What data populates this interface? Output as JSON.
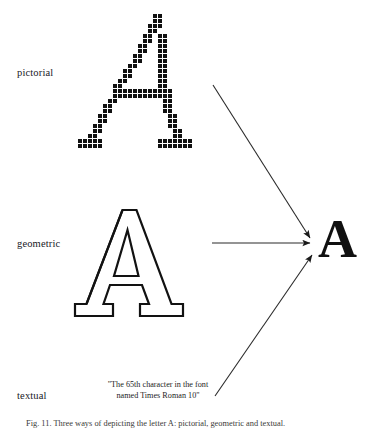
{
  "figure": {
    "caption": "Fig. 11.  Three ways of depicting the letter A: pictorial, geometric and textual.",
    "target_letter": "A",
    "rows": [
      {
        "label": "pictorial",
        "kind": "bitmap-grid"
      },
      {
        "label": "geometric",
        "kind": "outline-glyph"
      },
      {
        "label": "textual",
        "kind": "text-description"
      }
    ],
    "textual_description": {
      "line1": "\"The 65th character in the font",
      "line2": "named Times Roman 10\""
    },
    "arrows": [
      {
        "name": "arrow-pictorial-to-target",
        "from": [
          213,
          85
        ],
        "to": [
          311,
          239
        ]
      },
      {
        "name": "arrow-geometric-to-target",
        "from": [
          212,
          243
        ],
        "to": [
          311,
          243
        ]
      },
      {
        "name": "arrow-textual-to-target",
        "from": [
          215,
          396
        ],
        "to": [
          313,
          254
        ]
      }
    ],
    "colors": {
      "ink": "#111111",
      "paper": "#ffffff",
      "caption": "#3a3a38"
    },
    "pictorial_grid": {
      "cell": 5,
      "dot": 4,
      "cells": [
        [
          15,
          0
        ],
        [
          16,
          0
        ],
        [
          15,
          1
        ],
        [
          16,
          1
        ],
        [
          14,
          2
        ],
        [
          15,
          2
        ],
        [
          16,
          2
        ],
        [
          14,
          3
        ],
        [
          15,
          3
        ],
        [
          13,
          4
        ],
        [
          14,
          4
        ],
        [
          16,
          4
        ],
        [
          17,
          4
        ],
        [
          13,
          5
        ],
        [
          14,
          5
        ],
        [
          16,
          5
        ],
        [
          17,
          5
        ],
        [
          12,
          6
        ],
        [
          13,
          6
        ],
        [
          16,
          6
        ],
        [
          17,
          6
        ],
        [
          12,
          7
        ],
        [
          13,
          7
        ],
        [
          16,
          7
        ],
        [
          17,
          7
        ],
        [
          11,
          8
        ],
        [
          12,
          8
        ],
        [
          16,
          8
        ],
        [
          17,
          8
        ],
        [
          11,
          9
        ],
        [
          12,
          9
        ],
        [
          16,
          9
        ],
        [
          17,
          9
        ],
        [
          10,
          10
        ],
        [
          11,
          10
        ],
        [
          16,
          10
        ],
        [
          17,
          10
        ],
        [
          9,
          11
        ],
        [
          10,
          11
        ],
        [
          16,
          11
        ],
        [
          17,
          11
        ],
        [
          9,
          12
        ],
        [
          10,
          12
        ],
        [
          16,
          12
        ],
        [
          17,
          12
        ],
        [
          8,
          13
        ],
        [
          9,
          13
        ],
        [
          16,
          13
        ],
        [
          17,
          13
        ],
        [
          7,
          14
        ],
        [
          8,
          14
        ],
        [
          16,
          14
        ],
        [
          17,
          14
        ],
        [
          7,
          15
        ],
        [
          8,
          15
        ],
        [
          9,
          15
        ],
        [
          10,
          15
        ],
        [
          11,
          15
        ],
        [
          12,
          15
        ],
        [
          13,
          15
        ],
        [
          14,
          15
        ],
        [
          15,
          15
        ],
        [
          16,
          15
        ],
        [
          17,
          15
        ],
        [
          18,
          15
        ],
        [
          7,
          16
        ],
        [
          8,
          16
        ],
        [
          9,
          16
        ],
        [
          10,
          16
        ],
        [
          11,
          16
        ],
        [
          12,
          16
        ],
        [
          13,
          16
        ],
        [
          14,
          16
        ],
        [
          15,
          16
        ],
        [
          16,
          16
        ],
        [
          17,
          16
        ],
        [
          18,
          16
        ],
        [
          6,
          17
        ],
        [
          7,
          17
        ],
        [
          17,
          17
        ],
        [
          18,
          17
        ],
        [
          5,
          18
        ],
        [
          6,
          18
        ],
        [
          17,
          18
        ],
        [
          18,
          18
        ],
        [
          5,
          19
        ],
        [
          6,
          19
        ],
        [
          17,
          19
        ],
        [
          18,
          19
        ],
        [
          4,
          20
        ],
        [
          5,
          20
        ],
        [
          18,
          20
        ],
        [
          19,
          20
        ],
        [
          4,
          21
        ],
        [
          5,
          21
        ],
        [
          18,
          21
        ],
        [
          19,
          21
        ],
        [
          3,
          22
        ],
        [
          4,
          22
        ],
        [
          18,
          22
        ],
        [
          19,
          22
        ],
        [
          3,
          23
        ],
        [
          4,
          23
        ],
        [
          19,
          23
        ],
        [
          20,
          23
        ],
        [
          2,
          24
        ],
        [
          3,
          24
        ],
        [
          19,
          24
        ],
        [
          20,
          24
        ],
        [
          0,
          25
        ],
        [
          1,
          25
        ],
        [
          2,
          25
        ],
        [
          3,
          25
        ],
        [
          4,
          25
        ],
        [
          16,
          25
        ],
        [
          17,
          25
        ],
        [
          18,
          25
        ],
        [
          19,
          25
        ],
        [
          20,
          25
        ],
        [
          21,
          25
        ],
        [
          22,
          25
        ],
        [
          0,
          26
        ],
        [
          1,
          26
        ],
        [
          2,
          26
        ],
        [
          3,
          26
        ],
        [
          4,
          26
        ],
        [
          16,
          26
        ],
        [
          17,
          26
        ],
        [
          18,
          26
        ],
        [
          19,
          26
        ],
        [
          20,
          26
        ],
        [
          21,
          26
        ],
        [
          22,
          26
        ]
      ]
    }
  }
}
